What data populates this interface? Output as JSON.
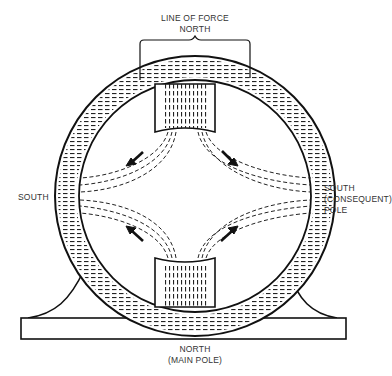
{
  "diagram": {
    "type": "motor-field-cross-section",
    "labels": {
      "top_line1": "LINE OF FORCE",
      "top_line2": "NORTH",
      "left": "SOUTH",
      "right_line1": "SOUTH",
      "right_line2": "(CONSEQUENT)",
      "right_line3": "POLE",
      "bottom_line1": "NORTH",
      "bottom_line2": "(MAIN POLE)"
    },
    "components": [
      "frame-ring",
      "north-pole-top",
      "north-pole-bottom",
      "mounting-base",
      "flux-paths",
      "flux-direction-arrows"
    ],
    "colors": {
      "line": "#1a1a1a",
      "background": "#ffffff"
    }
  }
}
